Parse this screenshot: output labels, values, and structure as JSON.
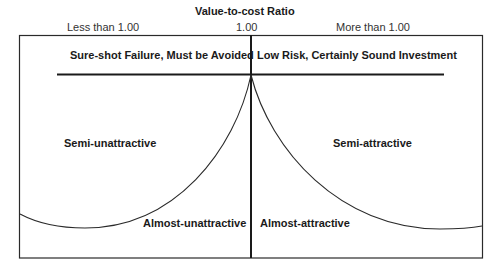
{
  "title": "Value-to-cost Ratio",
  "axis": {
    "left_label": "Less than 1.00",
    "center_label": "1.00",
    "right_label": "More than 1.00"
  },
  "header_regions": {
    "left": "Sure-shot Failure, Must be Avoided",
    "right": "Low Risk, Certainly Sound Investment"
  },
  "regions": {
    "upper_left": "Semi-unattractive",
    "upper_right": "Semi-attractive",
    "lower_left": "Almost-unattractive",
    "lower_right": "Almost-attractive"
  },
  "colors": {
    "line": "#2a2a2a",
    "text": "#1a1a1a"
  }
}
